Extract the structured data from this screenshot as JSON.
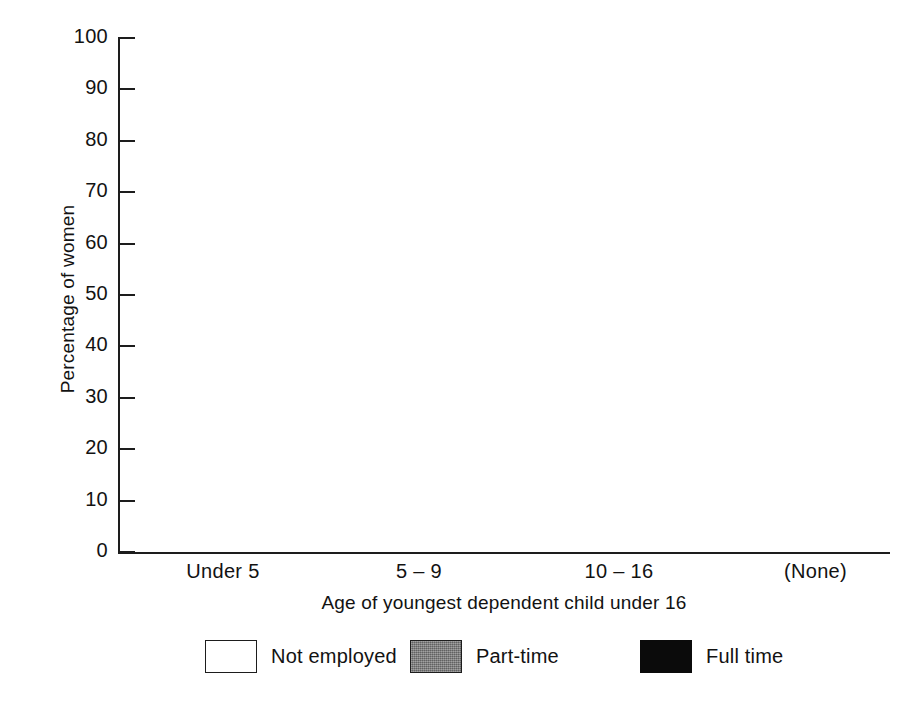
{
  "chart_data": {
    "type": "bar",
    "subtype": "stacked-bar-100-percent",
    "title": "",
    "xlabel": "Age of youngest dependent child under 16",
    "ylabel": "Percentage of women",
    "ylim": [
      0,
      100
    ],
    "ytick_step": 10,
    "yticks": [
      "100",
      "90",
      "80",
      "70",
      "60",
      "50",
      "40",
      "30",
      "20",
      "10",
      "0"
    ],
    "grid": false,
    "legend_position": "bottom",
    "categories": [
      "Under 5",
      "5 – 9",
      "10 – 16",
      "(None)"
    ],
    "series": [
      {
        "name": "Full time",
        "color": "#0b0b0b",
        "values": [
          13,
          21,
          33,
          53
        ]
      },
      {
        "name": "Part-time",
        "color": "#7d7d7d",
        "values": [
          31,
          46,
          45,
          22
        ]
      },
      {
        "name": "Not employed",
        "color": "#ffffff",
        "values": [
          56,
          33,
          22,
          25
        ]
      }
    ],
    "stack_order_bottom_to_top": [
      "Full time",
      "Part-time",
      "Not employed"
    ],
    "bars": [
      {
        "category": "Under 5",
        "segments": [
          {
            "series": "Full time",
            "value": 13,
            "label": "13",
            "boxed": true,
            "start": 0,
            "end": 13
          },
          {
            "series": "Part-time",
            "value": 31,
            "label": "31",
            "boxed": true,
            "start": 13,
            "end": 44
          },
          {
            "series": "Not employed",
            "value": 56,
            "label": "56",
            "boxed": false,
            "start": 44,
            "end": 100
          }
        ]
      },
      {
        "category": "5 – 9",
        "segments": [
          {
            "series": "Full time",
            "value": 21,
            "label": "21",
            "boxed": true,
            "start": 0,
            "end": 21
          },
          {
            "series": "Part-time",
            "value": 46,
            "label": "46",
            "boxed": true,
            "start": 21,
            "end": 67
          },
          {
            "series": "Not employed",
            "value": 33,
            "label": "33",
            "boxed": false,
            "start": 67,
            "end": 100
          }
        ]
      },
      {
        "category": "10 – 16",
        "segments": [
          {
            "series": "Full time",
            "value": 33,
            "label": "33",
            "boxed": true,
            "start": 0,
            "end": 33
          },
          {
            "series": "Part-time",
            "value": 45,
            "label": "45",
            "boxed": true,
            "start": 33,
            "end": 78
          },
          {
            "series": "Not employed",
            "value": 22,
            "label": "22",
            "boxed": false,
            "start": 78,
            "end": 100
          }
        ]
      },
      {
        "category": "(None)",
        "segments": [
          {
            "series": "Full time",
            "value": 53,
            "label": "53",
            "boxed": true,
            "start": 0,
            "end": 53
          },
          {
            "series": "Part-time",
            "value": 22,
            "label": "22",
            "boxed": true,
            "start": 53,
            "end": 75
          },
          {
            "series": "Not employed",
            "value": 25,
            "label": "25",
            "boxed": false,
            "start": 75,
            "end": 100
          }
        ]
      }
    ],
    "legend": [
      {
        "label": "Not employed",
        "swatch": "sw-none"
      },
      {
        "label": "Part-time",
        "swatch": "sw-part"
      },
      {
        "label": "Full time",
        "swatch": "sw-full"
      }
    ]
  },
  "axes": {
    "y_title": "Percentage of women",
    "x_title": "Age of youngest dependent child under 16",
    "y_ticks": [
      "100",
      "90",
      "80",
      "70",
      "60",
      "50",
      "40",
      "30",
      "20",
      "10",
      "0"
    ]
  },
  "colors": {
    "axis": "#1d1d1d",
    "full_time": "#0b0b0b",
    "part_time": "#7d7d7d",
    "not_employed": "#ffffff",
    "text": "#121212"
  }
}
